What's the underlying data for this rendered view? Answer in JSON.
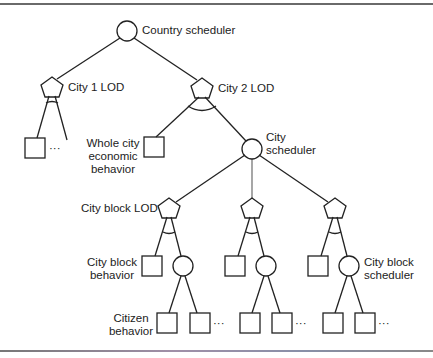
{
  "diagram": {
    "colors": {
      "stroke": "#222222",
      "text": "#222222",
      "rule": "#6a6a6a"
    },
    "legend_shapes": {
      "circle": "scheduler",
      "pentagon": "LOD selector",
      "square": "behavior"
    },
    "nodes": [
      {
        "id": "country",
        "shape": "circle",
        "label": "Country scheduler"
      },
      {
        "id": "city1",
        "shape": "pentagon",
        "label": "City 1 LOD"
      },
      {
        "id": "city2",
        "shape": "pentagon",
        "label": "City 2 LOD"
      },
      {
        "id": "whole_city",
        "shape": "square",
        "label": "Whole city economic behavior"
      },
      {
        "id": "city_sched",
        "shape": "circle",
        "label": "City scheduler"
      },
      {
        "id": "block_lod",
        "shape": "pentagon",
        "label": "City block LOD"
      },
      {
        "id": "block_behavior",
        "shape": "square",
        "label": "City block behavior"
      },
      {
        "id": "block_sched",
        "shape": "circle",
        "label": "City block scheduler"
      },
      {
        "id": "citizen",
        "shape": "square",
        "label": "Citizen behavior"
      }
    ],
    "labels": {
      "country": "Country scheduler",
      "city1": "City 1 LOD",
      "city2": "City 2 LOD",
      "whole_city_l1": "Whole city",
      "whole_city_l2": "economic",
      "whole_city_l3": "behavior",
      "city_sched_l1": "City",
      "city_sched_l2": "scheduler",
      "block_lod": "City block LOD",
      "block_behavior_l1": "City block",
      "block_behavior_l2": "behavior",
      "block_sched_l1": "City block",
      "block_sched_l2": "scheduler",
      "citizen_l1": "Citizen",
      "citizen_l2": "behavior",
      "ellipsis": "···"
    }
  }
}
